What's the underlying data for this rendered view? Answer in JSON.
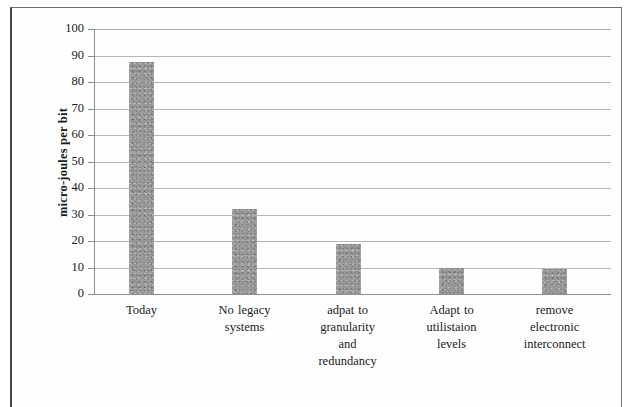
{
  "chart_data": {
    "type": "bar",
    "title": "",
    "subtitle": "",
    "xlabel": "",
    "ylabel": "micro-joules per bit",
    "categories": [
      "Today",
      "No legacy systems",
      "adpat to granularity and redundancy",
      "Adapt to utilistaion levels",
      "remove electronic interconnect"
    ],
    "category_lines": [
      [
        "Today"
      ],
      [
        "No legacy",
        "systems"
      ],
      [
        "adpat to",
        "granularity",
        "and",
        "redundancy"
      ],
      [
        "Adapt to",
        "utilistaion",
        "levels"
      ],
      [
        "remove",
        "electronic",
        "interconnect"
      ]
    ],
    "values": [
      87.5,
      32,
      19,
      10,
      9.5
    ],
    "series": [
      {
        "name": "micro-joules per bit",
        "values": [
          87.5,
          32,
          19,
          10,
          9.5
        ]
      }
    ],
    "ylim": [
      0,
      100
    ],
    "ytick_step": 10,
    "ytick_labels": [
      "100",
      "90",
      "80",
      "70",
      "60",
      "50",
      "40",
      "30",
      "20",
      "10",
      "0"
    ],
    "ytick_values": [
      100,
      90,
      80,
      70,
      60,
      50,
      40,
      30,
      20,
      10,
      0
    ],
    "grid": "horizontal",
    "legend": "none",
    "bar_color": "#9a9a9a",
    "gridline_color": "#b6b6b6",
    "axis_color": "#8f8f8f",
    "background_color": "#ffffff"
  }
}
